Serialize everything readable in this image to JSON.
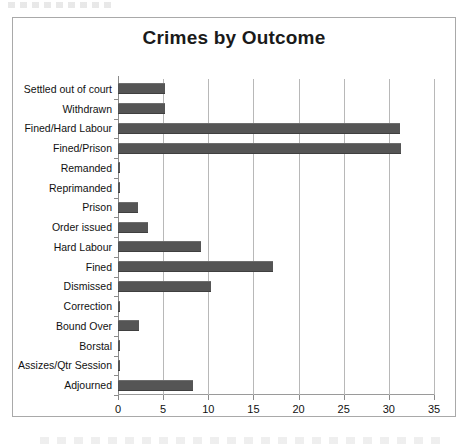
{
  "chart_data": {
    "type": "bar",
    "orientation": "horizontal",
    "title": "Crimes by Outcome",
    "xlabel": "",
    "ylabel": "",
    "xlim": [
      0,
      35
    ],
    "xticks": [
      0,
      5,
      10,
      15,
      20,
      25,
      30,
      35
    ],
    "grid": "vertical",
    "legend": "none",
    "bar_color": "#555555",
    "categories": [
      "Settled out of court",
      "Withdrawn",
      "Fined/Hard Labour",
      "Fined/Prison",
      "Remanded",
      "Reprimanded",
      "Prison",
      "Order issued",
      "Hard Labour",
      "Fined",
      "Dismissed",
      "Correction",
      "Bound Over",
      "Borstal",
      "Assizes/Qtr Session",
      "Adjourned"
    ],
    "values": [
      5.2,
      5.2,
      31.2,
      31.3,
      0.2,
      0.2,
      2.2,
      3.3,
      9.2,
      17.2,
      10.3,
      0.2,
      2.3,
      0.2,
      0.2,
      8.3
    ]
  },
  "figure": {
    "top_artifact": "scan-smudge",
    "bottom_artifact": "cropped-caption-text"
  }
}
